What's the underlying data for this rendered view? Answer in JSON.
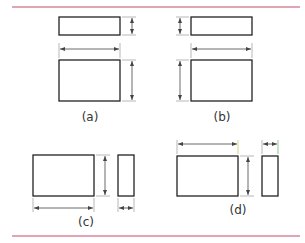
{
  "figure": {
    "rule_color": "#d9869a",
    "stroke_color": "#222222",
    "dim_color": "#444444",
    "panels": [
      {
        "id": "a",
        "label": "(a)",
        "description": "Top view above front view, height dimensions on right, width dimension between views"
      },
      {
        "id": "b",
        "label": "(b)",
        "description": "Top view above front view, height dimensions on left, width dimension between views"
      },
      {
        "id": "c",
        "label": "(c)",
        "description": "Front and side views, width dimensions below, height dimension between views"
      },
      {
        "id": "d",
        "label": "(d)",
        "description": "Front and side views, width dimensions above, height dimension between views"
      }
    ]
  }
}
